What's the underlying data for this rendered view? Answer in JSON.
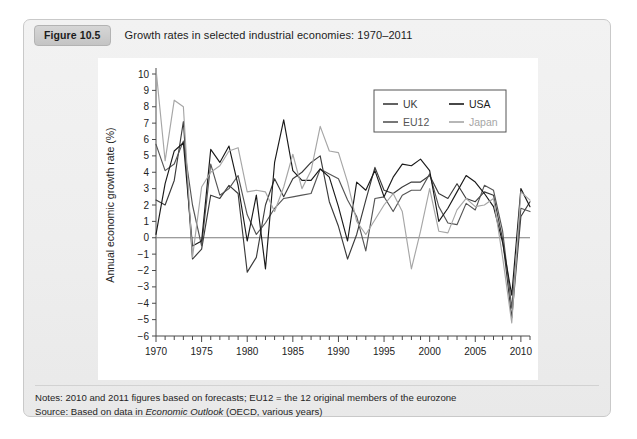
{
  "figure": {
    "label": "Figure 10.5",
    "title": "Growth rates in selected industrial economies: 1970–2011"
  },
  "footer": {
    "notes_prefix": "Notes: ",
    "notes": "2010 and 2011 figures based on forecasts; EU12 = the 12 original members of the eurozone",
    "source_prefix": "Source: ",
    "source_lead": "Based on data in ",
    "source_italic": "Economic Outlook",
    "source_tail": " (OECD, various years)"
  },
  "colors": {
    "uk": "#3b3b3b",
    "eu12": "#555555",
    "usa": "#1a1a1a",
    "japan": "#a6a6a6",
    "axis": "#4a4a4a",
    "zero": "#7b7b7b",
    "panel_bg": "#ffffff",
    "card_bg": "#eeeeee",
    "chip_bg": "#cccccc"
  },
  "chart_data": {
    "type": "line",
    "title": "Growth rates in selected industrial economies: 1970–2011",
    "xlabel": "",
    "ylabel": "Annual economic growth rate (%)",
    "xlim": [
      1970,
      2011
    ],
    "ylim": [
      -6,
      10
    ],
    "ytick_step": 1,
    "yticks": [
      -6,
      -5,
      -4,
      -3,
      -2,
      -1,
      0,
      1,
      2,
      3,
      4,
      5,
      6,
      7,
      8,
      9,
      10
    ],
    "xticks_major": [
      1970,
      1975,
      1980,
      1985,
      1990,
      1995,
      2000,
      2005,
      2010
    ],
    "xtick_minor_step": 1,
    "grid": false,
    "zero_line": true,
    "legend_position": "top-right",
    "legend_columns": 2,
    "legend_order": [
      "UK",
      "USA",
      "EU12",
      "Japan"
    ],
    "x": [
      1970,
      1971,
      1972,
      1973,
      1974,
      1975,
      1976,
      1977,
      1978,
      1979,
      1980,
      1981,
      1982,
      1983,
      1984,
      1985,
      1986,
      1987,
      1988,
      1989,
      1990,
      1991,
      1992,
      1993,
      1994,
      1995,
      1996,
      1997,
      1998,
      1999,
      2000,
      2001,
      2002,
      2003,
      2004,
      2005,
      2006,
      2007,
      2008,
      2009,
      2010,
      2011
    ],
    "series": [
      {
        "name": "UK",
        "color": "#3b3b3b",
        "values": [
          2.3,
          2.0,
          3.5,
          7.1,
          -1.3,
          -0.7,
          2.6,
          2.4,
          3.2,
          2.7,
          -2.1,
          -1.2,
          2.0,
          3.6,
          2.5,
          3.6,
          4.0,
          4.6,
          5.0,
          2.2,
          0.7,
          -1.3,
          0.2,
          2.3,
          4.3,
          2.9,
          2.7,
          3.1,
          3.4,
          3.4,
          3.8,
          2.7,
          2.4,
          3.3,
          2.4,
          2.2,
          2.8,
          2.6,
          -0.1,
          -4.9,
          1.3,
          2.2
        ]
      },
      {
        "name": "EU12",
        "color": "#555555",
        "values": [
          5.7,
          4.1,
          4.5,
          5.9,
          2.0,
          -0.5,
          4.5,
          2.6,
          3.0,
          3.8,
          1.4,
          0.2,
          0.9,
          1.8,
          2.4,
          2.5,
          2.6,
          2.7,
          4.2,
          3.9,
          3.6,
          2.3,
          1.3,
          -0.8,
          2.4,
          2.5,
          1.6,
          2.6,
          2.9,
          2.9,
          3.9,
          1.9,
          0.9,
          0.8,
          2.1,
          1.7,
          3.2,
          2.9,
          0.4,
          -4.3,
          1.8,
          1.6
        ]
      },
      {
        "name": "USA",
        "color": "#1a1a1a",
        "values": [
          0.2,
          3.3,
          5.3,
          5.8,
          -0.5,
          -0.2,
          5.4,
          4.6,
          5.6,
          3.2,
          -0.2,
          2.6,
          -1.9,
          4.6,
          7.2,
          4.1,
          3.5,
          3.5,
          4.2,
          3.7,
          1.9,
          -0.2,
          3.4,
          2.9,
          4.1,
          2.5,
          3.7,
          4.5,
          4.4,
          4.8,
          4.1,
          1.0,
          1.8,
          2.8,
          3.8,
          3.4,
          2.7,
          1.9,
          -0.3,
          -3.5,
          3.0,
          1.9
        ]
      },
      {
        "name": "Japan",
        "color": "#a6a6a6",
        "values": [
          10.3,
          4.7,
          8.4,
          8.0,
          -1.2,
          3.1,
          4.0,
          4.4,
          5.3,
          5.5,
          2.8,
          2.9,
          2.8,
          1.6,
          3.1,
          5.1,
          3.0,
          4.1,
          6.8,
          5.3,
          5.2,
          3.4,
          1.0,
          0.2,
          1.1,
          2.0,
          2.7,
          1.6,
          -1.9,
          0.4,
          3.0,
          0.4,
          0.3,
          1.7,
          2.4,
          1.9,
          2.0,
          2.4,
          -1.2,
          -5.2,
          2.8,
          2.3
        ]
      }
    ]
  }
}
